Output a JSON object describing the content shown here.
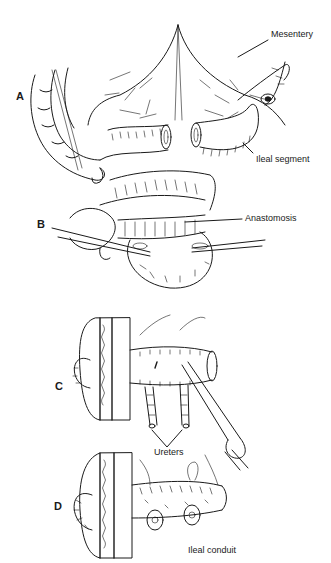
{
  "figure": {
    "panels": [
      {
        "id": "A",
        "label": "A",
        "annotations": [
          "Mesentery",
          "Ileal segment"
        ]
      },
      {
        "id": "B",
        "label": "B",
        "annotations": [
          "Anastomosis"
        ]
      },
      {
        "id": "C",
        "label": "C",
        "annotations": [
          "Ureters"
        ]
      },
      {
        "id": "D",
        "label": "D",
        "annotations": [
          "Ileal conduit"
        ]
      }
    ],
    "labels": {
      "mesentery": "Mesentery",
      "ileal_segment": "Ileal segment",
      "anastomosis": "Anastomosis",
      "ureters": "Ureters",
      "ileal_conduit": "Ileal conduit"
    },
    "colors": {
      "ink": "#1a1a1a",
      "background": "#ffffff"
    }
  }
}
